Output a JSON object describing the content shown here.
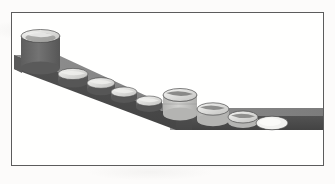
{
  "figure": {
    "title": "",
    "caption": "",
    "media": "scanned-grayscale-line-figure",
    "border_color": "#5c5c5c",
    "paper_color": "#fcfbfa"
  },
  "palette": {
    "ramp_top": "#8a8a8a",
    "ramp_top_dark": "#7b7b7b",
    "ramp_side": "#4f4f4f",
    "ramp_side_dark": "#454545",
    "ramp_end": "#5a5a5a",
    "cylinder_dark_body": "#6b6b6b",
    "cylinder_dark_side": "#565656",
    "cylinder_light_body": "#c9c9c7",
    "cylinder_light_side": "#b0b0ae",
    "cylinder_top_light": "#efefed",
    "cylinder_top_shadow": "#9a9a98",
    "disc_white": "#f2f2f0",
    "outline": "#3a3a3a"
  },
  "ramp": {
    "name": "conveyor-ramp",
    "segments": [
      {
        "id": "sloped-segment",
        "from_x": 14,
        "from_y": 62,
        "to_x": 176,
        "to_y": 122,
        "description": "descending slope from upper-left to bend"
      },
      {
        "id": "flat-segment",
        "from_x": 176,
        "from_y": 122,
        "to_x": 323,
        "to_y": 122,
        "description": "horizontal run from bend to right edge"
      }
    ],
    "bend_x": 176,
    "thickness": 14
  },
  "objects": [
    {
      "id": "cylinder-1",
      "label": "tall cylinder",
      "order": 1,
      "cx": 40,
      "cy": 66,
      "rx": 20,
      "ry": 7,
      "height": 38,
      "tone": "dark",
      "note": "tallest, dark body, light elliptical top rim"
    },
    {
      "id": "cylinder-2",
      "label": "short cylinder",
      "order": 2,
      "cx": 73,
      "cy": 79,
      "rx": 15,
      "ry": 6,
      "height": 9,
      "tone": "dark",
      "note": "embedded in slope, light top"
    },
    {
      "id": "cylinder-3",
      "label": "short cylinder",
      "order": 3,
      "cx": 101,
      "cy": 88,
      "rx": 14,
      "ry": 6,
      "height": 8,
      "tone": "dark"
    },
    {
      "id": "cylinder-4",
      "label": "short cylinder",
      "order": 4,
      "cx": 124,
      "cy": 97,
      "rx": 13,
      "ry": 5,
      "height": 7,
      "tone": "dark"
    },
    {
      "id": "cylinder-5",
      "label": "short cylinder",
      "order": 5,
      "cx": 149,
      "cy": 106,
      "rx": 13,
      "ry": 5,
      "height": 7,
      "tone": "dark"
    },
    {
      "id": "cylinder-6",
      "label": "medium cylinder",
      "order": 6,
      "cx": 180,
      "cy": 104,
      "rx": 17,
      "ry": 7,
      "height": 20,
      "tone": "light",
      "note": "at the bend, brightest body"
    },
    {
      "id": "cylinder-7",
      "label": "low cylinder",
      "order": 7,
      "cx": 213,
      "cy": 114,
      "rx": 16,
      "ry": 7,
      "height": 12,
      "tone": "light"
    },
    {
      "id": "cylinder-8",
      "label": "flat cylinder",
      "order": 8,
      "cx": 243,
      "cy": 120,
      "rx": 15,
      "ry": 6,
      "height": 6,
      "tone": "light"
    },
    {
      "id": "disc-9",
      "label": "flat disc",
      "order": 9,
      "cx": 272,
      "cy": 123,
      "rx": 16,
      "ry": 7,
      "height": 0,
      "tone": "white",
      "note": "zero height, pure ellipse"
    }
  ]
}
